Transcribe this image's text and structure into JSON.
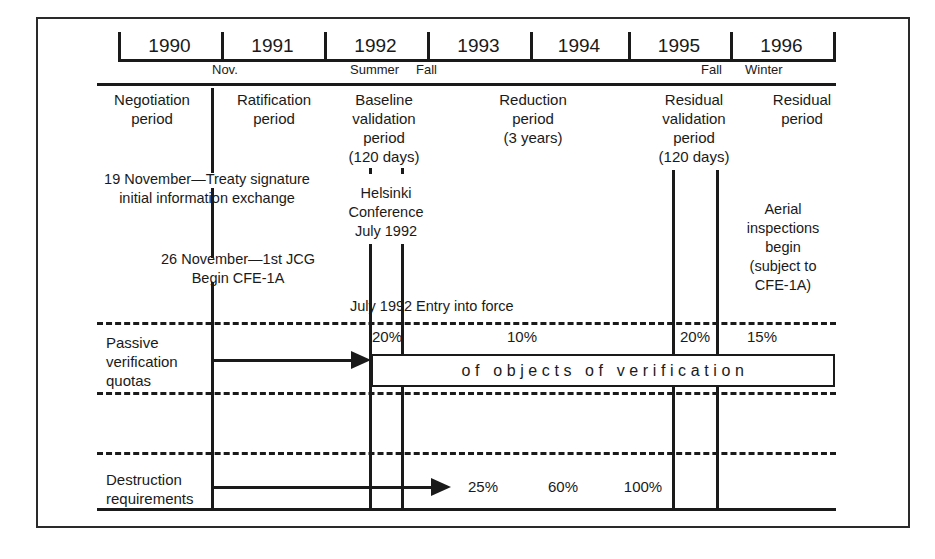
{
  "timeline": {
    "years": [
      "1990",
      "1991",
      "1992",
      "1993",
      "1994",
      "1995",
      "1996"
    ],
    "seasons": [
      {
        "label": "Nov.",
        "x": 230
      },
      {
        "label": "Summer",
        "x": 373
      },
      {
        "label": "Fall",
        "x": 426
      },
      {
        "label": "Fall",
        "x": 714
      },
      {
        "label": "Winter",
        "x": 766
      }
    ]
  },
  "periods": [
    {
      "name": "Negotiation\nperiod"
    },
    {
      "name": "Ratification\nperiod"
    },
    {
      "name": "Baseline\nvalidation\nperiod\n(120 days)"
    },
    {
      "name": "Reduction\nperiod\n(3 years)"
    },
    {
      "name": "Residual\nvalidation\nperiod\n(120 days)"
    },
    {
      "name": "Residual\nperiod"
    }
  ],
  "notes": {
    "treaty_signature": "19 November—Treaty signature\ninitial information exchange",
    "jcg": "26 November—1st JCG\nBegin CFE-1A",
    "helsinki": "Helsinki\nConference\nJuly 1992",
    "entry_into_force": "July 1992 Entry into force",
    "aerial": "Aerial\ninspections\nbegin\n(subject to\nCFE-1A)"
  },
  "rows": {
    "passive": {
      "label": "Passive\nverification\nquotas",
      "box_text": "of objects of verification",
      "percentages": [
        {
          "value": "20%",
          "x": 371
        },
        {
          "value": "10%",
          "x": 522
        },
        {
          "value": "20%",
          "x": 675
        },
        {
          "value": "15%",
          "x": 736
        }
      ]
    },
    "destruction": {
      "label": "Destruction\nrequirements",
      "percentages": [
        {
          "value": "25%",
          "x": 483
        },
        {
          "value": "60%",
          "x": 563
        },
        {
          "value": "100%",
          "x": 643
        }
      ]
    }
  },
  "colors": {
    "ink": "#1a1a1a",
    "background": "#ffffff"
  }
}
